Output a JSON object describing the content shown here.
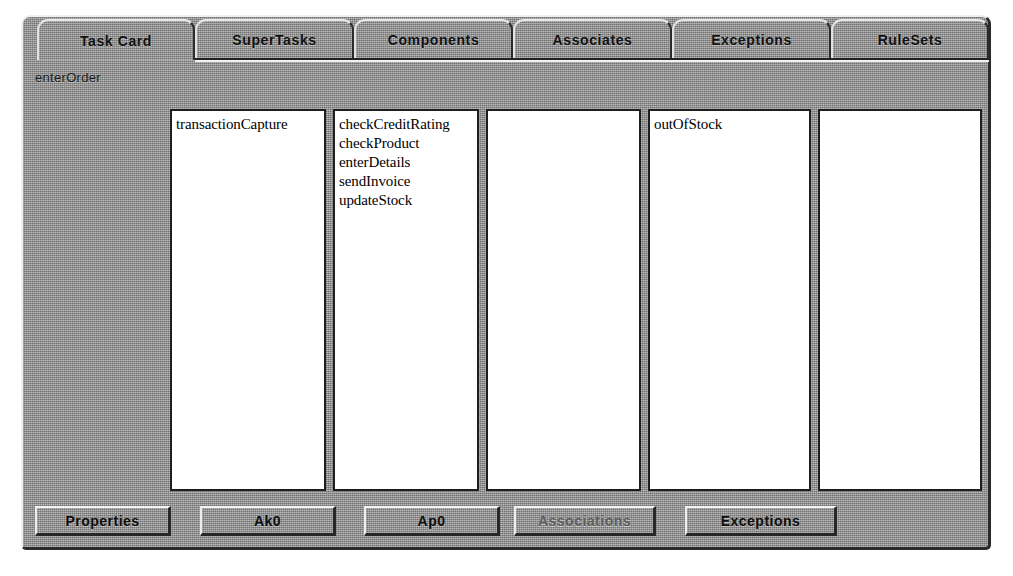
{
  "window": {
    "title": "Task Card"
  },
  "tabs": [
    {
      "label": "Task Card",
      "active": true,
      "x": 14,
      "width": 158
    },
    {
      "label": "SuperTasks",
      "active": false,
      "x": 172,
      "width": 159
    },
    {
      "label": "Components",
      "active": false,
      "x": 331,
      "width": 159
    },
    {
      "label": "Associates",
      "active": false,
      "x": 490,
      "width": 159
    },
    {
      "label": "Exceptions",
      "active": false,
      "x": 649,
      "width": 159
    },
    {
      "label": "RuleSets",
      "active": false,
      "x": 808,
      "width": 158
    }
  ],
  "content": {
    "context_label": "enterOrder"
  },
  "panels": [
    {
      "name": "task-card-panel",
      "x": 0,
      "width": 156,
      "items": [
        "transactionCapture"
      ]
    },
    {
      "name": "supertasks-panel",
      "x": 163,
      "width": 146,
      "items": [
        "checkCreditRating",
        "checkProduct",
        "enterDetails",
        "sendInvoice",
        "updateStock"
      ]
    },
    {
      "name": "components-panel",
      "x": 316,
      "width": 155,
      "items": []
    },
    {
      "name": "associates-panel",
      "x": 478,
      "width": 163,
      "items": [
        "outOfStock"
      ]
    },
    {
      "name": "rulesets-panel",
      "x": 648,
      "width": 164,
      "items": []
    }
  ],
  "buttons": [
    {
      "label": "Properties",
      "x": 0,
      "width": 136,
      "disabled": false
    },
    {
      "label": "Ak0",
      "x": 165,
      "width": 136,
      "disabled": false
    },
    {
      "label": "Ap0",
      "x": 329,
      "width": 136,
      "disabled": false
    },
    {
      "label": "Associations",
      "x": 479,
      "width": 142,
      "disabled": true
    },
    {
      "label": "Exceptions",
      "x": 650,
      "width": 152,
      "disabled": false
    }
  ],
  "colors": {
    "face": "#9d9d9d",
    "panel_background": "#ffffff",
    "border_dark": "#1e1e1e",
    "highlight": "#efefef",
    "text": "#111111",
    "text_disabled": "#5d5d5d"
  }
}
